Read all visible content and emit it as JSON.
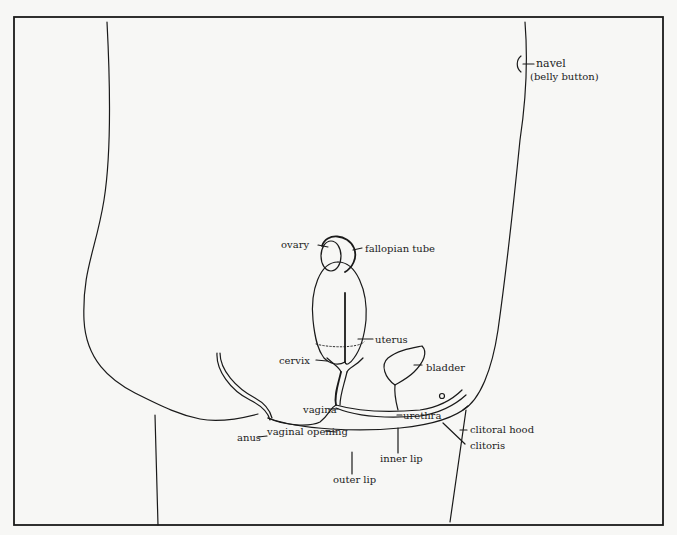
{
  "diagram": {
    "type": "anatomical-line-drawing",
    "colors": {
      "background": "#f7f7f5",
      "line": "#1a1a1a",
      "text": "#222222"
    },
    "labels": {
      "navel": "navel",
      "navel_sub": "(belly button)",
      "ovary": "ovary",
      "fallopian_tube": "fallopian tube",
      "uterus": "uterus",
      "cervix": "cervix",
      "bladder": "bladder",
      "vagina": "vagina",
      "urethra": "urethra",
      "vaginal_opening": "vaginal opening",
      "anus": "anus",
      "clitoral_hood": "clitoral hood",
      "clitoris": "clitoris",
      "inner_lip": "inner lip",
      "outer_lip": "outer lip"
    }
  }
}
